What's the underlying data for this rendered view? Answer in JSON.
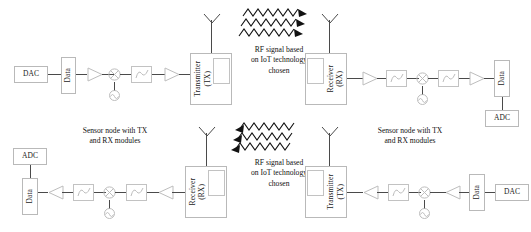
{
  "diagram": {
    "colors": {
      "wire": "#4a4a4a",
      "block_border": "#b9b9b9",
      "background": "#ffffff",
      "wave_fill": "#111111"
    },
    "captions": [
      {
        "id": "rf-caption-top",
        "lines": [
          "RF signal based",
          "on IoT technology",
          "chosen"
        ]
      },
      {
        "id": "sensor-node-caption-left",
        "lines": [
          "Sensor node with TX",
          "and RX modules"
        ]
      },
      {
        "id": "rf-caption-bottom",
        "lines": [
          "RF signal based",
          "on IoT technology",
          "chosen"
        ]
      },
      {
        "id": "sensor-node-caption-right",
        "lines": [
          "Sensor node with TX",
          "and RX modules"
        ]
      }
    ],
    "top_chain": {
      "direction": "left-to-right",
      "blocks": [
        {
          "id": "dac-top",
          "label": "DAC",
          "orientation": "horizontal",
          "kind": "converter"
        },
        {
          "id": "data-top-left",
          "label": "Data",
          "orientation": "vertical",
          "kind": "data"
        },
        {
          "id": "amp-1",
          "label": "",
          "orientation": "horizontal",
          "kind": "amplifier"
        },
        {
          "id": "mixer-1",
          "label": "",
          "orientation": "horizontal",
          "kind": "mixer"
        },
        {
          "id": "lo-1",
          "label": "",
          "orientation": "horizontal",
          "kind": "local-oscillator"
        },
        {
          "id": "filter-1",
          "label": "",
          "orientation": "horizontal",
          "kind": "filter"
        },
        {
          "id": "amp-2",
          "label": "",
          "orientation": "horizontal",
          "kind": "amplifier"
        },
        {
          "id": "transmitter-top",
          "label": "Transmitter\n(TX)",
          "orientation": "vertical",
          "kind": "transmitter"
        }
      ]
    },
    "top_rx_chain": {
      "direction": "left-to-right",
      "blocks": [
        {
          "id": "receiver-top",
          "label": "Receiver\n(RX)",
          "orientation": "vertical",
          "kind": "receiver"
        },
        {
          "id": "amp-3",
          "label": "",
          "orientation": "horizontal",
          "kind": "amplifier"
        },
        {
          "id": "filter-2",
          "label": "",
          "orientation": "horizontal",
          "kind": "filter"
        },
        {
          "id": "mixer-2",
          "label": "",
          "orientation": "horizontal",
          "kind": "mixer"
        },
        {
          "id": "lo-2",
          "label": "",
          "orientation": "horizontal",
          "kind": "local-oscillator"
        },
        {
          "id": "filter-3",
          "label": "",
          "orientation": "horizontal",
          "kind": "filter"
        },
        {
          "id": "amp-4",
          "label": "",
          "orientation": "horizontal",
          "kind": "amplifier"
        },
        {
          "id": "data-top-right",
          "label": "Data",
          "orientation": "vertical",
          "kind": "data"
        },
        {
          "id": "adc-top",
          "label": "ADC",
          "orientation": "horizontal",
          "kind": "converter"
        }
      ]
    },
    "bottom_rx_chain": {
      "direction": "right-to-left",
      "blocks": [
        {
          "id": "receiver-bottom",
          "label": "Receiver\n(RX)",
          "orientation": "vertical",
          "kind": "receiver"
        },
        {
          "id": "amp-5",
          "label": "",
          "orientation": "horizontal",
          "kind": "amplifier"
        },
        {
          "id": "filter-4",
          "label": "",
          "orientation": "horizontal",
          "kind": "filter"
        },
        {
          "id": "mixer-3",
          "label": "",
          "orientation": "horizontal",
          "kind": "mixer"
        },
        {
          "id": "lo-3",
          "label": "",
          "orientation": "horizontal",
          "kind": "local-oscillator"
        },
        {
          "id": "filter-5",
          "label": "",
          "orientation": "horizontal",
          "kind": "filter"
        },
        {
          "id": "amp-6",
          "label": "",
          "orientation": "horizontal",
          "kind": "amplifier"
        },
        {
          "id": "data-bottom-left",
          "label": "Data",
          "orientation": "vertical",
          "kind": "data"
        },
        {
          "id": "adc-bottom",
          "label": "ADC",
          "orientation": "horizontal",
          "kind": "converter"
        }
      ]
    },
    "bottom_tx_chain": {
      "direction": "right-to-left",
      "blocks": [
        {
          "id": "dac-bottom",
          "label": "DAC",
          "orientation": "horizontal",
          "kind": "converter"
        },
        {
          "id": "data-bottom-right",
          "label": "Data",
          "orientation": "vertical",
          "kind": "data"
        },
        {
          "id": "amp-7",
          "label": "",
          "orientation": "horizontal",
          "kind": "amplifier"
        },
        {
          "id": "mixer-4",
          "label": "",
          "orientation": "horizontal",
          "kind": "mixer"
        },
        {
          "id": "lo-4",
          "label": "",
          "orientation": "horizontal",
          "kind": "local-oscillator"
        },
        {
          "id": "filter-6",
          "label": "",
          "orientation": "horizontal",
          "kind": "filter"
        },
        {
          "id": "amp-8",
          "label": "",
          "orientation": "horizontal",
          "kind": "amplifier"
        },
        {
          "id": "transmitter-bottom",
          "label": "Transmitter\n(TX)",
          "orientation": "vertical",
          "kind": "transmitter"
        }
      ]
    },
    "labels": {
      "dac": "DAC",
      "adc": "ADC",
      "data": "Data",
      "transmitter_line1": "Transmitter",
      "transmitter_line2": "(TX)",
      "receiver_line1": "Receiver",
      "receiver_line2": "(RX)",
      "rf_line1": "RF signal based",
      "rf_line2": "on IoT technology",
      "rf_line3": "chosen",
      "sensor_line1": "Sensor node with TX",
      "sensor_line2": "and RX modules"
    },
    "rf_waves": [
      {
        "id": "rf-wave-top",
        "arrow_direction": "right",
        "count": 3
      },
      {
        "id": "rf-wave-bottom",
        "arrow_direction": "left",
        "count": 3
      }
    ],
    "antennas": [
      {
        "id": "antenna-tx-top"
      },
      {
        "id": "antenna-rx-top"
      },
      {
        "id": "antenna-rx-bottom"
      },
      {
        "id": "antenna-tx-bottom"
      }
    ]
  }
}
